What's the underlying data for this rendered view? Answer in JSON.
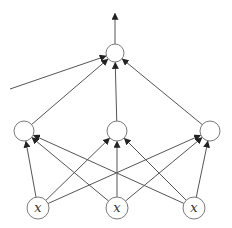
{
  "diagram": {
    "type": "neural-network",
    "layers": [
      {
        "name": "input",
        "nodes": [
          {
            "id": "x1",
            "label": "x"
          },
          {
            "id": "x2",
            "label": "x"
          },
          {
            "id": "x3",
            "label": "x"
          }
        ]
      },
      {
        "name": "hidden",
        "nodes": [
          {
            "id": "h1",
            "label": ""
          },
          {
            "id": "h2",
            "label": ""
          },
          {
            "id": "h3",
            "label": ""
          }
        ]
      },
      {
        "name": "output",
        "nodes": [
          {
            "id": "o1",
            "label": ""
          }
        ]
      }
    ],
    "edges": [
      {
        "from": "x1",
        "to": "h1"
      },
      {
        "from": "x1",
        "to": "h2"
      },
      {
        "from": "x1",
        "to": "h3"
      },
      {
        "from": "x2",
        "to": "h1"
      },
      {
        "from": "x2",
        "to": "h2"
      },
      {
        "from": "x2",
        "to": "h3"
      },
      {
        "from": "x3",
        "to": "h1"
      },
      {
        "from": "x3",
        "to": "h2"
      },
      {
        "from": "x3",
        "to": "h3"
      },
      {
        "from": "h1",
        "to": "o1"
      },
      {
        "from": "h2",
        "to": "o1"
      },
      {
        "from": "h3",
        "to": "o1"
      },
      {
        "from": "external",
        "to": "o1"
      },
      {
        "from": "o1",
        "to": "output-arrow"
      }
    ]
  }
}
